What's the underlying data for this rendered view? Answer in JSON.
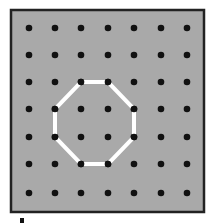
{
  "geoboard": {
    "background_color": "#a9a9a9",
    "border_color": "#222222",
    "dot_color": "#111111",
    "shape_color": "#ffffff",
    "grid_cols": 7,
    "grid_rows": 7,
    "dot_x": [
      29,
      55,
      81,
      108,
      134,
      161,
      187
    ],
    "dot_y": [
      28,
      55,
      82,
      109,
      137,
      164,
      193
    ],
    "shape": {
      "name": "octagon",
      "vertices": [
        [
          2,
          2
        ],
        [
          3,
          2
        ],
        [
          4,
          3
        ],
        [
          4,
          4
        ],
        [
          3,
          5
        ],
        [
          2,
          5
        ],
        [
          1,
          4
        ],
        [
          1,
          3
        ]
      ]
    }
  }
}
